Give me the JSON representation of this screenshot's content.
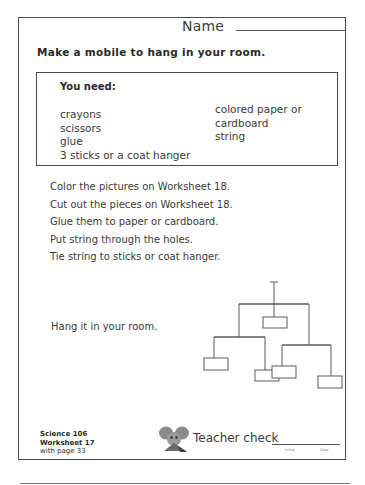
{
  "header": {
    "name_label": "Name"
  },
  "title": "Make a mobile to hang in your room.",
  "you_need": {
    "heading": "You need:",
    "left_items": [
      "crayons",
      "scissors",
      "glue",
      "3 sticks or a coat hanger"
    ],
    "right_items": [
      "colored paper or",
      "cardboard",
      "string"
    ]
  },
  "steps": [
    "Color the pictures on Worksheet 18.",
    "Cut out the pieces on Worksheet 18.",
    "Glue them to paper or cardboard.",
    "Put string through the holes.",
    "Tie string to sticks or coat hanger."
  ],
  "final_step": "Hang it in your room.",
  "diagram": {
    "label": "mobile-illustration",
    "line_color": "#5a5a5a",
    "pieces": 5
  },
  "footer": {
    "course": "Science 106",
    "worksheet": "Worksheet 17",
    "page_ref": "with page 33",
    "mascot_icon": "mouse-mascot-icon",
    "teacher_check_label": "Teacher check",
    "initial_label": "Initial",
    "date_label": "Date"
  },
  "colors": {
    "text": "#3a3a3a",
    "border": "#4a4a4a",
    "background": "#ffffff"
  }
}
